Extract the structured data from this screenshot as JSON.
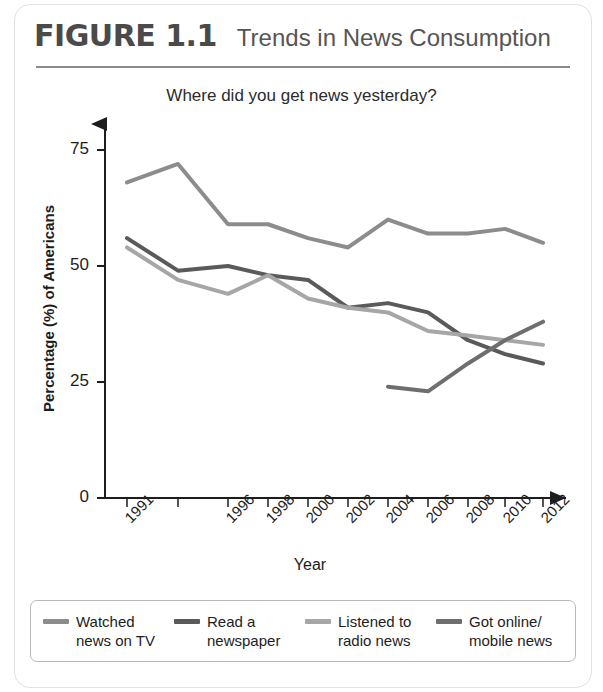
{
  "header": {
    "figure_number": "FIGURE 1.1",
    "title": "Trends in News Consumption"
  },
  "chart_data": {
    "type": "line",
    "title": "Where did you get news yesterday?",
    "xlabel": "Year",
    "ylabel": "Percentage (%) of Americans",
    "x": [
      1991,
      1994,
      1996,
      1998,
      2000,
      2002,
      2004,
      2006,
      2008,
      2010,
      2012
    ],
    "categories": [
      "1991",
      "",
      "1996",
      "1998",
      "2000",
      "2002",
      "2004",
      "2006",
      "2008",
      "2010",
      "2012"
    ],
    "tick_labels": [
      "1991",
      "",
      "1996",
      "1998",
      "2000",
      "2002",
      "2004",
      "2006",
      "2008",
      "2010",
      "2012"
    ],
    "ylim": [
      0,
      80
    ],
    "yticks": [
      0,
      25,
      50,
      75
    ],
    "ytick_labels": [
      "0",
      "25",
      "50",
      "75"
    ],
    "grid": false,
    "legend_position": "bottom",
    "series": [
      {
        "name": "Watched news on TV",
        "color": "#8c8c8c",
        "values": [
          68,
          72,
          59,
          59,
          56,
          54,
          60,
          57,
          57,
          58,
          55
        ]
      },
      {
        "name": "Read a newspaper",
        "color": "#5a5a5a",
        "values": [
          56,
          49,
          50,
          48,
          47,
          41,
          42,
          40,
          34,
          31,
          29
        ]
      },
      {
        "name": "Listened to radio news",
        "color": "#a6a6a6",
        "values": [
          54,
          47,
          44,
          48,
          43,
          41,
          40,
          36,
          35,
          34,
          33
        ]
      },
      {
        "name": "Got online/mobile news",
        "color": "#6e6e6e",
        "values": [
          null,
          null,
          null,
          null,
          null,
          null,
          24,
          23,
          29,
          34,
          38
        ]
      }
    ]
  },
  "legend": {
    "items": [
      {
        "label_line1": "Watched",
        "label_line2": "news on TV",
        "color": "#8c8c8c"
      },
      {
        "label_line1": "Read a",
        "label_line2": "newspaper",
        "color": "#5a5a5a"
      },
      {
        "label_line1": "Listened to",
        "label_line2": "radio news",
        "color": "#a6a6a6"
      },
      {
        "label_line1": "Got online/",
        "label_line2": "mobile news",
        "color": "#6e6e6e"
      }
    ]
  }
}
